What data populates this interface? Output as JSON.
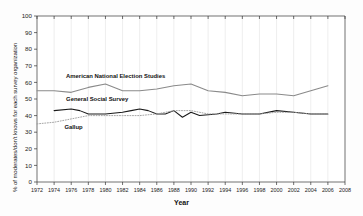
{
  "chart_data": {
    "type": "line",
    "title": "",
    "xlabel": "Year",
    "ylabel": "% of moderates/don't knows for each survey organization",
    "xlim": [
      1972,
      2008
    ],
    "ylim": [
      0,
      100
    ],
    "grid": "vertical-light",
    "legend_position": "inline-annotations",
    "xticks": [
      1972,
      1974,
      1976,
      1978,
      1980,
      1982,
      1984,
      1986,
      1988,
      1990,
      1992,
      1994,
      1996,
      1998,
      2000,
      2002,
      2004,
      2006,
      2008
    ],
    "yticks": [
      0,
      10,
      20,
      30,
      40,
      50,
      60,
      70,
      80,
      90,
      100
    ],
    "series": [
      {
        "name": "American National Election Studies",
        "color": "#8a8a8a",
        "style": "solid",
        "x": [
          1972,
          1974,
          1976,
          1978,
          1980,
          1982,
          1984,
          1986,
          1988,
          1990,
          1992,
          1994,
          1996,
          1998,
          2000,
          2002,
          2004,
          2006
        ],
        "values": [
          55,
          55,
          54,
          57,
          59,
          55,
          55,
          56,
          58,
          59,
          55,
          54,
          52,
          53,
          53,
          52,
          55,
          58
        ]
      },
      {
        "name": "General Social Survey",
        "color": "#1a1a1a",
        "style": "solid",
        "x": [
          1974,
          1976,
          1977,
          1978,
          1980,
          1982,
          1983,
          1984,
          1985,
          1986,
          1987,
          1988,
          1989,
          1990,
          1991,
          1993,
          1994,
          1996,
          1998,
          2000,
          2002,
          2004,
          2006
        ],
        "values": [
          43,
          44,
          43,
          41,
          41,
          42,
          43,
          44,
          43,
          41,
          41,
          43,
          39,
          42,
          40,
          41,
          42,
          41,
          41,
          43,
          42,
          41,
          41
        ]
      },
      {
        "name": "Gallup",
        "color": "#9b9b9b",
        "style": "dotted",
        "x": [
          1972,
          1974,
          1976,
          1978,
          1980,
          1982,
          1984,
          1986,
          1988,
          1990,
          1992,
          1994,
          1996,
          1998,
          2000,
          2002,
          2004,
          2006
        ],
        "values": [
          35,
          36,
          38,
          40,
          40,
          40,
          40,
          41,
          43,
          43,
          41,
          41,
          41,
          41,
          42,
          42,
          41,
          41
        ]
      }
    ],
    "annotations": [
      {
        "text": "American National Election Studies",
        "x": 1975.4,
        "y": 62.5
      },
      {
        "text": "General Social Survey",
        "x": 1975.4,
        "y": 48.8
      },
      {
        "text": "Gallup",
        "x": 1975.2,
        "y": 32.0
      }
    ]
  }
}
